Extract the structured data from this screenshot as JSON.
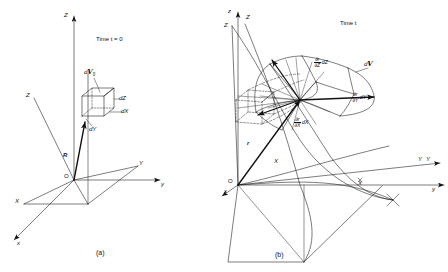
{
  "figure": {
    "caption_a": "(a)",
    "caption_b": "(b)",
    "panel_a": {
      "time_label": "Time t = 0",
      "origin": "O",
      "axes": [
        {
          "name": "Z-axis-upper",
          "label": "Z"
        },
        {
          "name": "Z-axis-material",
          "label": "Z"
        },
        {
          "name": "Y-axis-material",
          "label": "Y"
        },
        {
          "name": "Y-axis-spatial",
          "label": "y"
        },
        {
          "name": "X-axis-material",
          "label": "X"
        },
        {
          "name": "X-axis-spatial",
          "label": "x"
        }
      ],
      "position_vector": "R",
      "volume_element": "d",
      "volume_symbol": "V",
      "volume_subscript": "0",
      "edge_labels": [
        {
          "name": "edge-dZ",
          "label": "dZ"
        },
        {
          "name": "edge-dX",
          "label": "dX"
        },
        {
          "name": "edge-dY",
          "label": "dY"
        }
      ]
    },
    "panel_b": {
      "time_label": "Time t",
      "origin": "O",
      "axes": [
        {
          "name": "z-axis-spatial",
          "label": "z"
        },
        {
          "name": "Z-axis-material",
          "label": "Z"
        },
        {
          "name": "Z-axis-upper-right",
          "label": "Z"
        },
        {
          "name": "Y-axis-material",
          "label": "Y"
        },
        {
          "name": "Y-axis-spatial",
          "label": "y"
        },
        {
          "name": "Y-curve-label",
          "label": "Y"
        },
        {
          "name": "X-axis-material",
          "label": "X"
        },
        {
          "name": "X-axis-spatial",
          "label": "x"
        },
        {
          "name": "X-curve-label",
          "label": "X"
        }
      ],
      "position_vector": "r",
      "volume_element": "d",
      "volume_symbol": "V",
      "derivatives": [
        {
          "name": "deriv-Z",
          "num": "∂r",
          "den": "∂Z",
          "mult": "dZ"
        },
        {
          "name": "deriv-Y",
          "num": "∂r",
          "den": "∂Y",
          "mult": "dY"
        },
        {
          "name": "deriv-X",
          "num": "∂r",
          "den": "∂X",
          "mult": "dX"
        }
      ]
    },
    "colors": {
      "ink": "#111111",
      "background": "#ffffff"
    }
  }
}
